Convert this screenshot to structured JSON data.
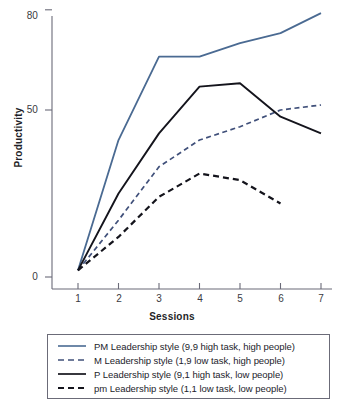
{
  "chart_data": {
    "type": "line",
    "title": "",
    "xlabel": "Sessions",
    "ylabel": "Productivity",
    "x": [
      1,
      2,
      3,
      4,
      5,
      6,
      7
    ],
    "xticklabels": [
      "1",
      "2",
      "3",
      "4",
      "5",
      "6",
      "7"
    ],
    "yticks": [
      0,
      50,
      80
    ],
    "yticklabels": [
      "0",
      "50",
      "80"
    ],
    "xlim": [
      0.6,
      7.4
    ],
    "ylim": [
      0,
      84
    ],
    "grid": false,
    "legend_position": "below-axes",
    "series": [
      {
        "name": "PM Leadership style (9,9 high task, high people)",
        "short": "PM",
        "color": "#4a6a92",
        "style": "solid",
        "values": [
          2,
          41,
          66,
          66,
          70,
          73,
          79
        ]
      },
      {
        "name": "M Leadership style (1,9 low task, high people)",
        "short": "M",
        "color": "#40507a",
        "style": "dashed",
        "values": [
          2,
          17,
          33,
          41,
          45,
          50,
          51.5
        ]
      },
      {
        "name": "P Leadership style (9,1 high task, low people)",
        "short": "P",
        "color": "#14141c",
        "style": "solid",
        "values": [
          2,
          25,
          43,
          57,
          58,
          48,
          43
        ]
      },
      {
        "name": "pm Leadership style (1,1 low task, low people)",
        "short": "pm",
        "color": "#14141c",
        "style": "dashed",
        "values": [
          2,
          12,
          24,
          31,
          29,
          22,
          null
        ]
      }
    ]
  },
  "axes": {
    "ylabel": "Productivity",
    "xlabel": "Sessions",
    "ytick_0": "0",
    "ytick_50": "50",
    "ytick_80": "80",
    "xtick_1": "1",
    "xtick_2": "2",
    "xtick_3": "3",
    "xtick_4": "4",
    "xtick_5": "5",
    "xtick_6": "6",
    "xtick_7": "7"
  },
  "legend": {
    "entries": [
      {
        "label": "PM Leadership style (9,9 high task, high people)"
      },
      {
        "label": "M Leadership style (1,9 low task, high people)"
      },
      {
        "label": "P Leadership style (9,1 high task, low people)"
      },
      {
        "label": "pm Leadership style (1,1 low task, low people)"
      }
    ]
  },
  "colors": {
    "blue": "#4a6a92",
    "blue_dash": "#40507a",
    "black": "#14141c",
    "axis": "#6b6b78",
    "text": "#23232b",
    "background": "#ffffff"
  }
}
